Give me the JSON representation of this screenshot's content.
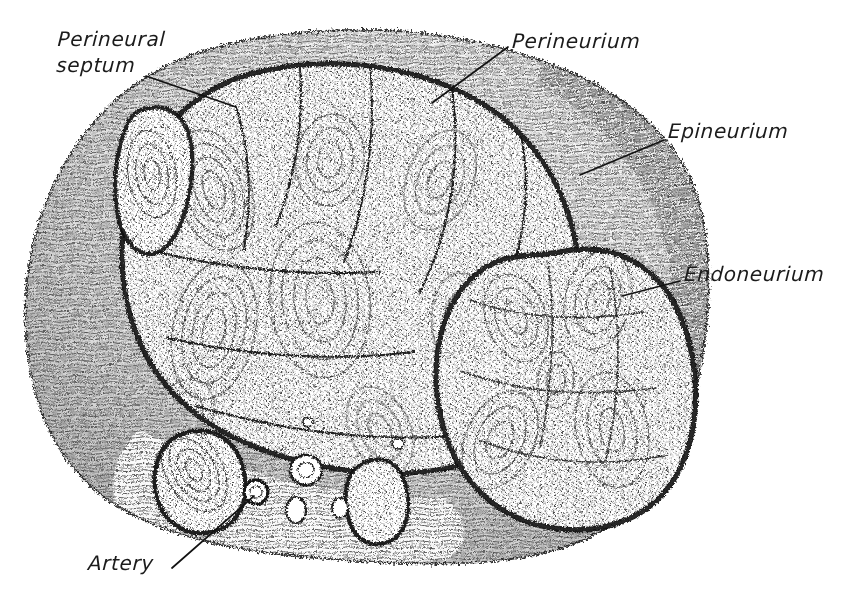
{
  "figure": {
    "style": "pen-and-ink stipple histological drawing",
    "background_color": "#ffffff",
    "ink_color": "#1b1b1b",
    "width": 853,
    "height": 600
  },
  "labels": [
    {
      "id": "perineural-septum",
      "text_line1": "Perineural",
      "text_line2": "septum",
      "x": 57,
      "y": 26,
      "leader": {
        "x1": 146,
        "y1": 76,
        "x2": 236,
        "y2": 107
      }
    },
    {
      "id": "perineurium",
      "text_line1": "Perineurium",
      "text_line2": "",
      "x": 512,
      "y": 30,
      "leader": {
        "x1": 508,
        "y1": 47,
        "x2": 432,
        "y2": 103
      }
    },
    {
      "id": "epineurium",
      "text_line1": "Epineurium",
      "text_line2": "",
      "x": 668,
      "y": 120,
      "leader": {
        "x1": 664,
        "y1": 140,
        "x2": 580,
        "y2": 175
      }
    },
    {
      "id": "endoneurium",
      "text_line1": "Endoneurium",
      "text_line2": "",
      "x": 684,
      "y": 263,
      "leader": {
        "x1": 680,
        "y1": 281,
        "x2": 622,
        "y2": 296
      }
    },
    {
      "id": "artery",
      "text_line1": "Artery",
      "text_line2": "",
      "x": 88,
      "y": 552,
      "leader": {
        "x1": 172,
        "y1": 568,
        "x2": 254,
        "y2": 496
      }
    }
  ],
  "structures": [
    {
      "id": "epineurium-outer-sheath",
      "name": "Epineurium",
      "description": "outer connective tissue sheath enclosing the whole nerve trunk"
    },
    {
      "id": "fascicle-large-upper-left",
      "name": "Large nerve fascicle",
      "description": "dominant bundle occupying the upper-left two thirds, subdivided by perineural septa"
    },
    {
      "id": "fascicle-right",
      "name": "Right nerve fascicle",
      "description": "large rounded bundle on the right side"
    },
    {
      "id": "fascicle-small-upper-left",
      "name": "Small nerve fascicle",
      "description": "small elongated bundle at the upper-left border"
    },
    {
      "id": "fascicle-lower-left",
      "name": "Small lower-left fascicle",
      "description": "small oval bundle near the lower-left margin"
    },
    {
      "id": "fascicle-lower-middle",
      "name": "Small lower-middle fascicle",
      "description": "small oval bundle at the lower border"
    },
    {
      "id": "artery-vessel",
      "name": "Artery",
      "description": "small artery within the epineurium near the lower-left margin"
    },
    {
      "id": "endoneurium-region",
      "name": "Endoneurium",
      "description": "fine stippled tissue inside each fascicle surrounding the nerve fibres"
    },
    {
      "id": "perineurium-ring",
      "name": "Perineurium",
      "description": "dense dark lamellar sheath bounding each fascicle"
    },
    {
      "id": "perineural-septum-line",
      "name": "Perineural septum",
      "description": "partition of perineurium dipping into the large fascicle"
    }
  ],
  "geometry": {
    "outer_outline": "M 296,33 C 392,24 470,34 548,63 C 628,93 684,141 700,206 C 716,272 708,345 692,404 C 676,463 642,513 586,539 C 524,567 438,566 356,561 C 274,556 186,546 122,509 C 60,473 31,410 26,336 C 21,260 42,182 96,120 C 148,60 220,41 296,33 Z",
    "fascicle_large": "M 250,74 C 324,54 412,63 478,101 C 540,137 574,200 580,274 C 586,346 566,404 524,436 C 482,468 414,480 344,470 C 276,460 212,436 172,392 C 132,348 116,286 124,222 C 132,158 180,94 250,74 Z",
    "fascicle_right": "M 560,252 C 616,240 662,268 682,320 C 702,372 700,434 676,476 C 652,518 604,536 552,528 C 500,520 460,484 444,430 C 428,376 436,314 470,280 C 500,250 528,258 560,252 Z",
    "fascicle_small_upper_left": "M 150,108 C 176,104 190,124 192,152 C 194,182 186,220 172,240 C 158,260 138,258 126,238 C 114,218 112,178 120,146 C 128,116 134,110 150,108 Z",
    "fascicle_lower_left": "M 188,432 C 216,426 238,442 244,472 C 250,502 238,526 212,532 C 186,538 162,522 156,494 C 150,466 162,438 188,432 Z",
    "fascicle_lower_middle": "M 372,460 C 392,456 406,472 408,498 C 410,524 400,542 380,544 C 360,546 348,530 346,504 C 344,478 354,464 372,460 Z",
    "artery_vessel": {
      "cx": 256,
      "cy": 492,
      "rx": 12,
      "ry": 12
    },
    "septa": [
      "M 236,107 C 250,150 252,200 244,250",
      "M 300,68 C 304,120 296,176 276,226",
      "M 370,64 C 376,130 368,200 344,262",
      "M 452,90 C 462,160 450,232 420,292",
      "M 520,130 C 534,196 522,262 492,316",
      "M 150,250 C 220,268 300,276 380,272",
      "M 168,338 C 248,356 330,362 414,352",
      "M 196,406 C 280,430 366,442 452,436"
    ]
  },
  "colors": {
    "ink": "#1b1b1b",
    "mid_ink": "#4a4a4a",
    "light_ink": "#7d7d7d",
    "paper": "#ffffff"
  }
}
